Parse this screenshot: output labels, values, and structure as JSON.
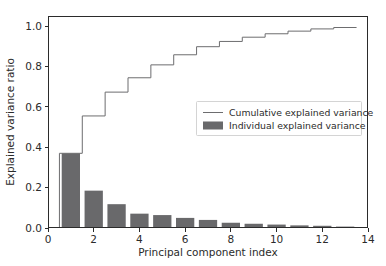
{
  "chart_data": {
    "type": "bar",
    "title": "",
    "xlabel": "Principal component index",
    "ylabel": "Explained variance ratio",
    "xlim": [
      0,
      14
    ],
    "ylim": [
      0.0,
      1.05
    ],
    "xticks": [
      0,
      2,
      4,
      6,
      8,
      10,
      12,
      14
    ],
    "xtick_labels": [
      "0",
      "2",
      "4",
      "6",
      "8",
      "10",
      "12",
      "14"
    ],
    "yticks": [
      0.0,
      0.2,
      0.4,
      0.6,
      0.8,
      1.0
    ],
    "ytick_labels": [
      "0.0",
      "0.2",
      "0.4",
      "0.6",
      "0.8",
      "1.0"
    ],
    "grid": false,
    "legend_position": "center right",
    "categories": [
      1,
      2,
      3,
      4,
      5,
      6,
      7,
      8,
      9,
      10,
      11,
      12,
      13
    ],
    "series": [
      {
        "name": "Individual explained variance",
        "type": "bar",
        "color": "#69696b",
        "values": [
          0.37,
          0.185,
          0.118,
          0.071,
          0.064,
          0.05,
          0.04,
          0.026,
          0.021,
          0.017,
          0.013,
          0.011,
          0.007
        ]
      },
      {
        "name": "Cumulative explained variance",
        "type": "step",
        "color": "#6d6d6f",
        "values": [
          0.37,
          0.555,
          0.673,
          0.744,
          0.808,
          0.858,
          0.898,
          0.924,
          0.945,
          0.962,
          0.975,
          0.986,
          0.993
        ]
      }
    ],
    "bar_width": 0.8
  },
  "legend": {
    "entries": [
      {
        "label": "Cumulative explained variance",
        "marker": "line"
      },
      {
        "label": "Individual explained variance",
        "marker": "patch"
      }
    ]
  },
  "colors": {
    "background": "#ffffff",
    "axis": "#2b2b2b",
    "bar_fill": "#69696b",
    "line": "#6d6d6f",
    "legend_border": "#c9c9c9"
  }
}
